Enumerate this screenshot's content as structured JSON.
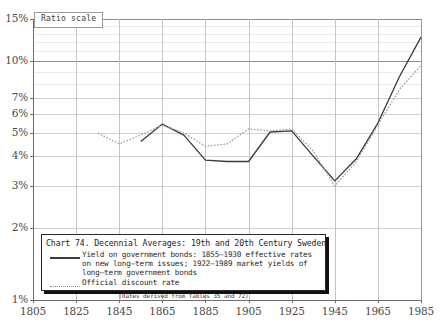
{
  "scale_badge": {
    "label": "Ratio scale"
  },
  "legend": {
    "title": "Chart 74. Decennial Averages: 19th and 20th Century Sweden",
    "entries": [
      {
        "style": "solid",
        "text": "Yield on government bonds: 1855–1930 effective rates on new long–term issues; 1922–1989 market yields of long–term government bonds"
      },
      {
        "style": "dotted",
        "text": "Official discount rate"
      }
    ],
    "note": "(Rates derived from Tables 35 and 72)"
  },
  "chart_data": {
    "type": "line",
    "title": "Chart 74. Decennial Averages: 19th and 20th Century Sweden",
    "xlabel": "",
    "ylabel": "",
    "yscale": "log",
    "ylim": [
      1,
      15
    ],
    "xlim": [
      1805,
      1985
    ],
    "grid": true,
    "legend_position": "bottom-left",
    "ytick_labels": [
      "15%",
      "10%",
      "7%",
      "6%",
      "5%",
      "4%",
      "3%",
      "2%",
      "1%"
    ],
    "ytick_values": [
      15,
      10,
      7,
      6,
      5,
      4,
      3,
      2,
      1
    ],
    "xtick_labels": [
      "1805",
      "1825",
      "1845",
      "1865",
      "1885",
      "1905",
      "1925",
      "1945",
      "1965",
      "1985"
    ],
    "xtick_values": [
      1805,
      1825,
      1845,
      1865,
      1885,
      1905,
      1925,
      1945,
      1965,
      1985
    ],
    "colors": {
      "solid": "#3a3a3a",
      "dotted": "#9a9a9a",
      "grid": "#c9c9c9",
      "axis": "#6e6e6e"
    },
    "series": [
      {
        "name": "Yield on government bonds",
        "style": "solid",
        "color": "#3a3a3a",
        "x": [
          1855,
          1865,
          1875,
          1885,
          1895,
          1905,
          1915,
          1925,
          1935,
          1945,
          1955,
          1965,
          1975,
          1985
        ],
        "values": [
          4.6,
          5.45,
          4.9,
          3.85,
          3.8,
          3.8,
          5.05,
          5.1,
          4.0,
          3.15,
          3.9,
          5.5,
          8.6,
          12.6
        ]
      },
      {
        "name": "Official discount rate",
        "style": "dotted",
        "color": "#9a9a9a",
        "x": [
          1835,
          1845,
          1855,
          1865,
          1875,
          1885,
          1895,
          1905,
          1915,
          1925,
          1935,
          1945,
          1955,
          1965,
          1975,
          1985
        ],
        "values": [
          5.0,
          4.5,
          4.9,
          5.4,
          5.0,
          4.4,
          4.5,
          5.2,
          5.1,
          5.2,
          4.2,
          3.0,
          3.8,
          5.4,
          7.6,
          9.6
        ]
      }
    ]
  }
}
